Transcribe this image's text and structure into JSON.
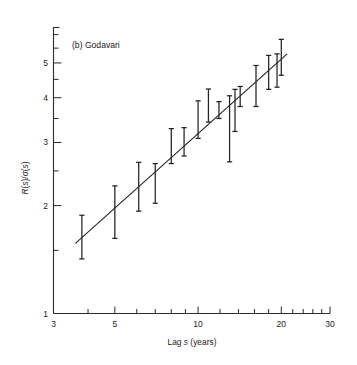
{
  "figure": {
    "panel_label": "(b)",
    "panel_name": "Godavari",
    "panel_title": "(b)   Godavari"
  },
  "chart_data": {
    "type": "scatter",
    "title": "(b)  Godavari",
    "xlabel": "Lag s (years)",
    "ylabel": "R(s)/σ(s)",
    "xscale": "log",
    "yscale": "log",
    "xlim": [
      3,
      30
    ],
    "ylim": [
      1,
      6.3
    ],
    "grid": false,
    "legend": "none",
    "x_ticks_labeled": [
      3,
      5,
      10,
      20,
      30
    ],
    "x_tick_labels": [
      "3",
      "5",
      "10",
      "20",
      "30"
    ],
    "x_ticks_minor": [
      4,
      6,
      7,
      8,
      9,
      12,
      14,
      16,
      18,
      22,
      24,
      26,
      28
    ],
    "y_ticks_labeled": [
      1,
      2,
      3,
      4,
      5
    ],
    "y_tick_labels": [
      "1",
      "2",
      "3",
      "4",
      "5"
    ],
    "y_ticks_minor": [
      1.5,
      2.5,
      3.5,
      4.5,
      5.5,
      6
    ],
    "error_bar_style": "capped-vertical",
    "points": [
      {
        "x": 3.8,
        "y": 1.66,
        "ylow": 1.42,
        "yhigh": 1.88
      },
      {
        "x": 5.0,
        "y": 1.92,
        "ylow": 1.62,
        "yhigh": 2.27
      },
      {
        "x": 6.1,
        "y": 2.24,
        "ylow": 1.93,
        "yhigh": 2.64
      },
      {
        "x": 7.0,
        "y": 2.3,
        "ylow": 2.03,
        "yhigh": 2.62
      },
      {
        "x": 8.0,
        "y": 2.74,
        "ylow": 2.62,
        "yhigh": 3.28
      },
      {
        "x": 8.9,
        "y": 2.88,
        "ylow": 2.75,
        "yhigh": 3.3
      },
      {
        "x": 10.0,
        "y": 3.22,
        "ylow": 3.08,
        "yhigh": 3.92
      },
      {
        "x": 10.9,
        "y": 3.55,
        "ylow": 3.42,
        "yhigh": 4.23
      },
      {
        "x": 11.9,
        "y": 3.62,
        "ylow": 3.5,
        "yhigh": 3.9
      },
      {
        "x": 13.0,
        "y": 3.3,
        "ylow": 2.65,
        "yhigh": 4.05
      },
      {
        "x": 13.6,
        "y": 3.55,
        "ylow": 3.22,
        "yhigh": 4.22
      },
      {
        "x": 14.2,
        "y": 4.02,
        "ylow": 3.78,
        "yhigh": 4.3
      },
      {
        "x": 16.2,
        "y": 4.35,
        "ylow": 3.78,
        "yhigh": 4.92
      },
      {
        "x": 18.0,
        "y": 4.7,
        "ylow": 4.22,
        "yhigh": 5.25
      },
      {
        "x": 19.3,
        "y": 4.78,
        "ylow": 4.28,
        "yhigh": 5.3
      },
      {
        "x": 20.0,
        "y": 5.2,
        "ylow": 4.62,
        "yhigh": 5.82
      }
    ],
    "fit_line": {
      "label": "least-squares fit",
      "x_start": 3.6,
      "y_start": 1.57,
      "x_end": 21.0,
      "y_end": 5.3
    }
  }
}
